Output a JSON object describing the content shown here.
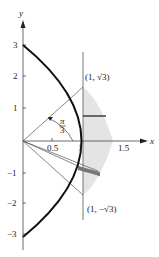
{
  "figure": {
    "axes": {
      "x_label": "x",
      "y_label": "y",
      "x_ticks": [
        "0.5",
        "1",
        "1.5"
      ],
      "y_ticks": [
        "3",
        "2",
        "1",
        "−1",
        "−2",
        "−3"
      ]
    },
    "angle_label": {
      "numerator": "π",
      "denominator": "3"
    },
    "points": [
      {
        "label": "(1, √3)"
      },
      {
        "label": "(1, −√3)"
      }
    ],
    "colors": {
      "curve": "#111111",
      "shade": "#e4e4e4",
      "line": "#555555"
    }
  }
}
